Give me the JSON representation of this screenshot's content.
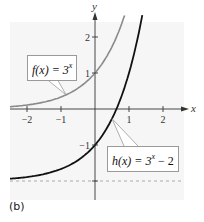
{
  "panel_label": "(b)",
  "colors": {
    "background": "#ffffff",
    "plot_background": "#f6f6f6",
    "axis": "#333333",
    "f_curve": "#8a8a8a",
    "h_curve": "#111111",
    "asymptote": "#9a9a9a"
  },
  "chart_data": {
    "type": "line",
    "title": "",
    "xlabel": "x",
    "ylabel": "y",
    "xlim": [
      -2.5,
      2.6
    ],
    "ylim": [
      -2.6,
      2.6
    ],
    "x_ticks": [
      -2,
      -1,
      1,
      2
    ],
    "x_tick_labels": [
      "−2",
      "−1",
      "1",
      "2"
    ],
    "y_ticks": [
      -1,
      1,
      2
    ],
    "y_tick_labels": [
      "−1",
      "1",
      "2"
    ],
    "grid": false,
    "series": [
      {
        "name": "f(x) = 3^x",
        "label_func": "f(x) = 3",
        "label_exp": "x",
        "color": "#8a8a8a",
        "x": [
          -2.5,
          -2,
          -1.5,
          -1,
          -0.5,
          0,
          0.5,
          0.87
        ],
        "values": [
          0.064,
          0.111,
          0.192,
          0.333,
          0.577,
          1.0,
          1.732,
          2.6
        ]
      },
      {
        "name": "h(x) = 3^x − 2",
        "label_func": "h(x) = 3",
        "label_exp": "x",
        "label_tail": " − 2",
        "color": "#111111",
        "x": [
          -2.5,
          -2,
          -1.5,
          -1,
          -0.5,
          0,
          0.5,
          0.63,
          1,
          1.39
        ],
        "values": [
          -1.936,
          -1.889,
          -1.808,
          -1.667,
          -1.423,
          -1.0,
          -0.268,
          0.0,
          1.0,
          2.6
        ]
      }
    ],
    "annotations": [
      {
        "type": "asymptote",
        "orientation": "horizontal",
        "y": -2,
        "style": "dashed"
      }
    ],
    "legend": "callout boxes"
  }
}
